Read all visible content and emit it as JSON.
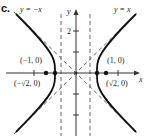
{
  "figure": {
    "part_label": "c.",
    "x_axis_label": "x",
    "y_axis_label": "y",
    "y_tick_label": "2",
    "asymptote_labels": {
      "negative": "y = −x",
      "positive": "y = x"
    },
    "points": {
      "left_vertex": "(−1, 0)",
      "right_vertex": "(1, 0)",
      "left_focus": "(−√2, 0)",
      "right_focus": "(√2, 0)"
    },
    "colors": {
      "curve": "#111111",
      "dashed": "#444444",
      "axis": "#333333"
    }
  }
}
